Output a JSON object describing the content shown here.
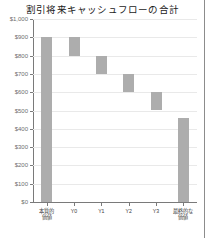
{
  "chart_data": {
    "type": "bar",
    "subtype": "waterfall",
    "title": "割引将来キャッシュフローの合計",
    "xlabel": "",
    "ylabel": "",
    "ylim": [
      0,
      1000
    ],
    "ytick_step": 100,
    "grid": true,
    "legend": false,
    "y_tick_labels": [
      "$1,000",
      "$900",
      "$800",
      "$700",
      "$600",
      "$500",
      "$400",
      "$300",
      "$200",
      "$100",
      "$0"
    ],
    "y_tick_values": [
      1000,
      900,
      800,
      700,
      600,
      500,
      400,
      300,
      200,
      100,
      0
    ],
    "categories": [
      "本質的\n価値",
      "Y0",
      "Y1",
      "Y2",
      "Y3",
      "最終的な\n価値"
    ],
    "bars": [
      {
        "label": "本質的\n価値",
        "base": 0,
        "top": 900,
        "value": 900
      },
      {
        "label": "Y0",
        "base": 800,
        "top": 900,
        "value": 100
      },
      {
        "label": "Y1",
        "base": 700,
        "top": 800,
        "value": 100
      },
      {
        "label": "Y2",
        "base": 600,
        "top": 700,
        "value": 100
      },
      {
        "label": "Y3",
        "base": 500,
        "top": 600,
        "value": 100
      },
      {
        "label": "最終的な\n価値",
        "base": 0,
        "top": 460,
        "value": 460
      }
    ],
    "bar_color": "#adadad",
    "axis_color": "#7a7a7a",
    "grid_color": "#e9e9e9"
  }
}
